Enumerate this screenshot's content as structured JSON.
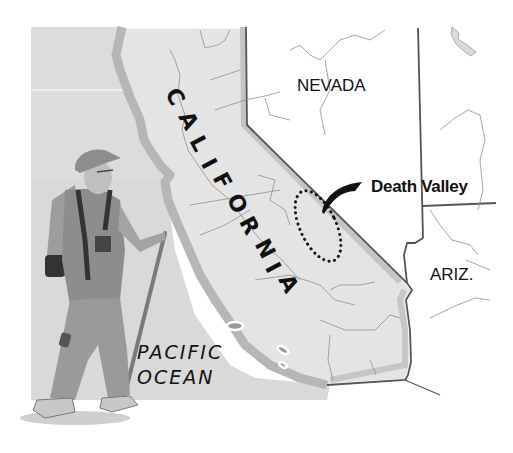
{
  "map": {
    "labels": {
      "state_main": "CALIFORNIA",
      "state_letters": [
        "C",
        "A",
        "L",
        "I",
        "F",
        "O",
        "R",
        "N",
        "I",
        "A"
      ],
      "neighbor_north_east": "NEVADA",
      "neighbor_south_east": "ARIZ.",
      "ocean_line1": "PACIFIC",
      "ocean_line2": "OCEAN",
      "highlight": "Death Valley"
    },
    "colors": {
      "ocean": "#d9d9d9",
      "land_california": "#e3e3e3",
      "coast_band": "#b5b5b5",
      "border": "#555555",
      "rivers": "#8a8a8a",
      "background": "#ffffff"
    },
    "illustration": "hiker-with-walking-stick-and-backpack"
  }
}
